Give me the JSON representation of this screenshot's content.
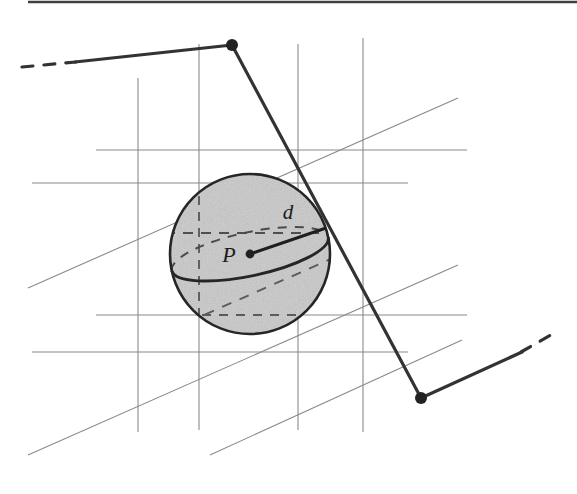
{
  "figure": {
    "kind": "technical-line-drawing",
    "caption_text": "",
    "width": 577,
    "height": 494,
    "background_color": "#ffffff",
    "scan_rule": {
      "name": "top-scan-rule",
      "color": "#2b2b2b",
      "y": 2,
      "x_start": 28,
      "x_end": 577,
      "thickness": 2.4
    }
  },
  "labels": {
    "center_point": "P",
    "radius": "d"
  },
  "colors": {
    "sphere_fill": "#c9c9c9",
    "sphere_outline": "#262626",
    "grid_line": "#8a8a8a",
    "diagonal_line": "#8a8a8a",
    "path_line": "#333333",
    "vertex_dot": "#222222",
    "label_text": "#1b1b1b",
    "dashed_hidden": "#4a4a4a"
  },
  "sphere": {
    "name": "shaded-sphere",
    "center_x": 250,
    "center_y": 254,
    "radius": 80,
    "outline_width": 2.6,
    "equator": {
      "rx": 80,
      "ry": 22,
      "rotation_deg": -12
    },
    "latitude_dashed": {
      "rx": 72,
      "ry": 15,
      "rotation_deg": -6,
      "y_offset": -21
    },
    "meridian_dashed_x": 199
  },
  "radius_marker": {
    "name": "radius-d",
    "from_x": 250,
    "from_y": 254,
    "to_x": 326,
    "to_y": 228,
    "dot_radius": 4.4,
    "label_x": 288,
    "label_y": 219,
    "label_font_size": 21
  },
  "center_label": {
    "x": 229,
    "y": 262,
    "font_size": 22
  },
  "grid": {
    "name": "perspective-grid",
    "stroke_width": 1.1,
    "verticals": [
      {
        "x": 138,
        "y1": 78,
        "y2": 432
      },
      {
        "x": 199,
        "y1": 44,
        "y2": 430
      },
      {
        "x": 298,
        "y1": 44,
        "y2": 430
      },
      {
        "x": 363,
        "y1": 38,
        "y2": 432
      }
    ],
    "horizontals": [
      {
        "y": 150,
        "x1": 96,
        "x2": 467
      },
      {
        "y": 183,
        "x1": 32,
        "x2": 408
      },
      {
        "y": 315,
        "x1": 96,
        "x2": 467
      },
      {
        "y": 352,
        "x1": 32,
        "x2": 408
      }
    ],
    "diagonals": [
      {
        "x1": 28,
        "y1": 288,
        "x2": 458,
        "y2": 98
      },
      {
        "x1": 28,
        "y1": 455,
        "x2": 458,
        "y2": 265
      },
      {
        "x1": 210,
        "y1": 455,
        "x2": 462,
        "y2": 340
      }
    ]
  },
  "path": {
    "name": "ray-polyline",
    "stroke_width": 3.2,
    "vertex_dot_radius": 6,
    "solid_points": [
      {
        "x": 75,
        "y": 62
      },
      {
        "x": 232,
        "y": 45
      },
      {
        "x": 421,
        "y": 398
      },
      {
        "x": 522,
        "y": 352
      }
    ],
    "vertices": [
      {
        "x": 232,
        "y": 45
      },
      {
        "x": 421,
        "y": 398
      }
    ],
    "dash_tail_start": {
      "x1": 22,
      "y1": 67,
      "x2": 76,
      "y2": 62
    },
    "dash_tail_end": {
      "x1": 521,
      "y1": 352,
      "x2": 556,
      "y2": 332
    }
  }
}
